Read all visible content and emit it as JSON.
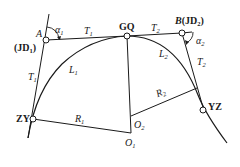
{
  "diagram": {
    "type": "compound curve (two circular arcs)",
    "points": {
      "A": {
        "label": "A",
        "alt_label": "(JD",
        "alt_sub": "1",
        "alt_close": ")",
        "x": 46,
        "y": 40
      },
      "GQ": {
        "label": "GQ",
        "x": 127,
        "y": 36
      },
      "B": {
        "label": "B",
        "paren": "(JD",
        "sub": "2",
        "close": ")",
        "x": 182,
        "y": 33
      },
      "YZ": {
        "label": "YZ",
        "x": 203,
        "y": 110
      },
      "ZY": {
        "label": "ZY",
        "x": 33,
        "y": 119
      },
      "O1": {
        "label": "O",
        "sub": "1",
        "x": 131,
        "y": 133
      },
      "O2": {
        "label": "O",
        "sub": "2",
        "x": 131,
        "y": 116
      }
    },
    "labels": {
      "alpha1": {
        "main": "α",
        "sub": "1"
      },
      "alpha2": {
        "main": "α",
        "sub": "2"
      },
      "T1_top": {
        "main": "T",
        "sub": "1"
      },
      "T1_left": {
        "main": "T",
        "sub": "1"
      },
      "T2_top": {
        "main": "T",
        "sub": "2"
      },
      "T2_right": {
        "main": "T",
        "sub": "2"
      },
      "L1": {
        "main": "L",
        "sub": "1"
      },
      "L2": {
        "main": "L",
        "sub": "2"
      },
      "R1": {
        "main": "R",
        "sub": "1"
      },
      "R2": {
        "main": "R",
        "sub": "2"
      }
    },
    "colors": {
      "line": "#1a1a1a",
      "background": "#ffffff"
    }
  }
}
